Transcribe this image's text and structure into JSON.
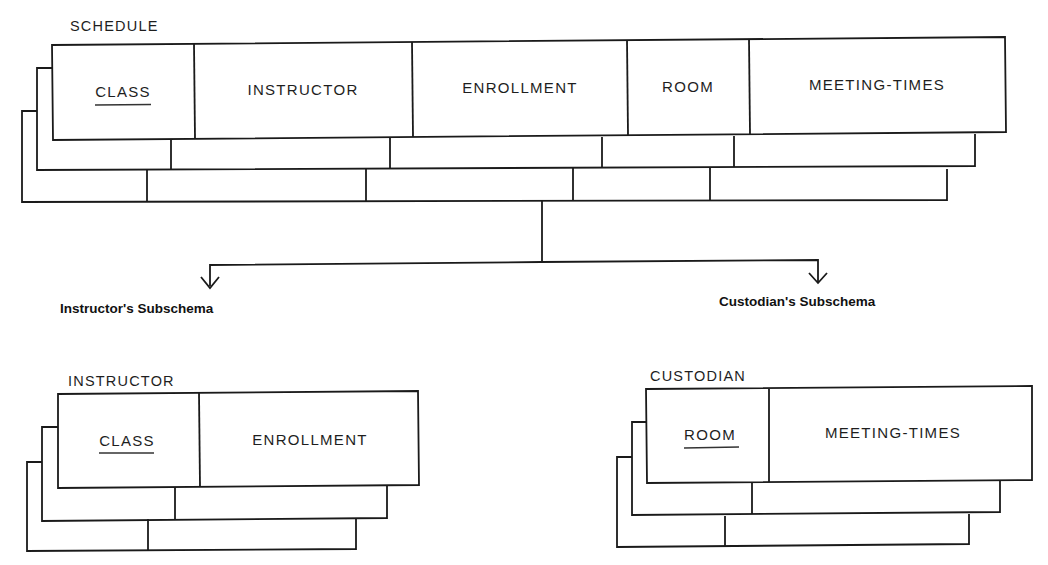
{
  "schedule": {
    "title": "SCHEDULE",
    "fields": [
      "CLASS",
      "INSTRUCTOR",
      "ENROLLMENT",
      "ROOM",
      "MEETING-TIMES"
    ],
    "key_field": "CLASS"
  },
  "branches": {
    "left_label": "Instructor's Subschema",
    "right_label": "Custodian's Subschema"
  },
  "instructor": {
    "title": "INSTRUCTOR",
    "fields": [
      "CLASS",
      "ENROLLMENT"
    ],
    "key_field": "CLASS"
  },
  "custodian": {
    "title": "CUSTODIAN",
    "fields": [
      "ROOM",
      "MEETING-TIMES"
    ],
    "key_field": "ROOM"
  },
  "colors": {
    "line": "#1a1a1a",
    "background": "#ffffff"
  }
}
